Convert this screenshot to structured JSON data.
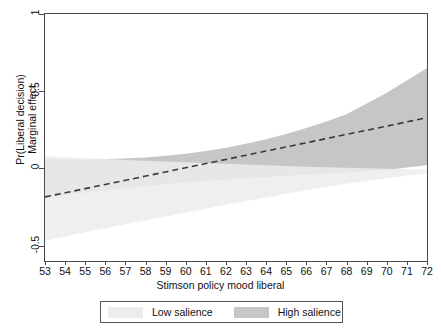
{
  "chart_data": {
    "type": "line",
    "title": "",
    "xlabel": "Stimson policy mood liberal",
    "ylabel_line1": "Pr(Liberal decision)",
    "ylabel_line2": "Marginal effect",
    "xlim": [
      53,
      72
    ],
    "ylim": [
      -0.6,
      1.0
    ],
    "xticks": [
      53,
      54,
      55,
      56,
      57,
      58,
      59,
      60,
      61,
      62,
      63,
      64,
      65,
      66,
      67,
      68,
      69,
      70,
      71,
      72
    ],
    "yticks": [
      1,
      0.5,
      0,
      -0.5
    ],
    "ytick_labels": [
      "1",
      "0.5",
      "0",
      "-0.5"
    ],
    "grid": false,
    "legend_position": "bottom",
    "x": [
      53,
      54,
      55,
      56,
      57,
      58,
      59,
      60,
      61,
      62,
      63,
      64,
      65,
      66,
      67,
      68,
      69,
      70,
      71,
      72
    ],
    "series": [
      {
        "name": "Marginal effect (dashed estimate)",
        "style": "dashed",
        "color": "#3a3a3a",
        "values": [
          -0.185,
          -0.158,
          -0.131,
          -0.104,
          -0.077,
          -0.05,
          -0.023,
          0.004,
          0.031,
          0.058,
          0.085,
          0.112,
          0.139,
          0.166,
          0.193,
          0.22,
          0.247,
          0.274,
          0.301,
          0.328
        ]
      },
      {
        "name": "High salience",
        "style": "band",
        "color": "#c6c6c6",
        "upper": [
          0.06,
          0.058,
          0.058,
          0.06,
          0.064,
          0.071,
          0.081,
          0.095,
          0.112,
          0.133,
          0.159,
          0.189,
          0.223,
          0.261,
          0.304,
          0.35,
          0.42,
          0.49,
          0.57,
          0.65
        ],
        "lower": [
          -0.19,
          -0.173,
          -0.157,
          -0.142,
          -0.128,
          -0.115,
          -0.103,
          -0.092,
          -0.082,
          -0.073,
          -0.064,
          -0.056,
          -0.049,
          -0.042,
          -0.035,
          -0.028,
          -0.02,
          -0.01,
          0.005,
          0.02
        ]
      },
      {
        "name": "Low salience",
        "style": "band",
        "color": "#ececec",
        "upper": [
          0.078,
          0.072,
          0.066,
          0.06,
          0.055,
          0.05,
          0.045,
          0.04,
          0.035,
          0.03,
          0.025,
          0.02,
          0.015,
          0.011,
          0.007,
          0.004,
          0.001,
          -0.002,
          -0.005,
          -0.008
        ],
        "lower": [
          -0.468,
          -0.441,
          -0.414,
          -0.388,
          -0.362,
          -0.336,
          -0.311,
          -0.286,
          -0.261,
          -0.236,
          -0.212,
          -0.188,
          -0.164,
          -0.141,
          -0.12,
          -0.1,
          -0.082,
          -0.064,
          -0.047,
          -0.032
        ]
      }
    ],
    "legend": [
      {
        "label": "Low salience",
        "color": "#ececec",
        "swatch": "low-salience-swatch"
      },
      {
        "label": "High salience",
        "color": "#c6c6c6",
        "swatch": "high-salience-swatch"
      }
    ]
  }
}
